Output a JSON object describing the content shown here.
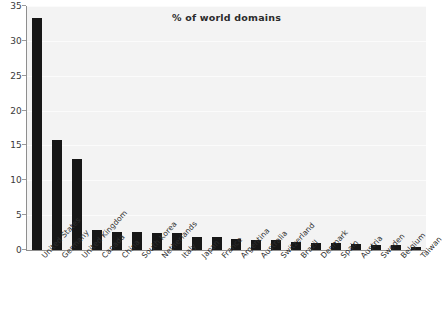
{
  "chart_data": {
    "type": "bar",
    "title": "% of world domains",
    "xlabel": "",
    "ylabel": "",
    "ylim": [
      0,
      35
    ],
    "yticks": [
      0,
      5,
      10,
      15,
      20,
      25,
      30,
      35
    ],
    "grid": true,
    "legend": null,
    "bar_color": "#171717",
    "plot_background": "#f3f3f3",
    "categories": [
      "United States",
      "Germany",
      "United Kingdom",
      "Canada",
      "China",
      "South Korea",
      "Netherlands",
      "Italy",
      "Japan",
      "France",
      "Argentina",
      "Australia",
      "Switzerland",
      "Brazil",
      "Denmark",
      "Spain",
      "Austria",
      "Sweden",
      "Belgium",
      "Taiwan"
    ],
    "values": [
      33.3,
      15.8,
      13.0,
      2.8,
      2.6,
      2.6,
      2.5,
      2.5,
      1.9,
      1.8,
      1.6,
      1.45,
      1.4,
      1.1,
      1.05,
      0.95,
      0.85,
      0.75,
      0.75,
      0.5
    ]
  }
}
